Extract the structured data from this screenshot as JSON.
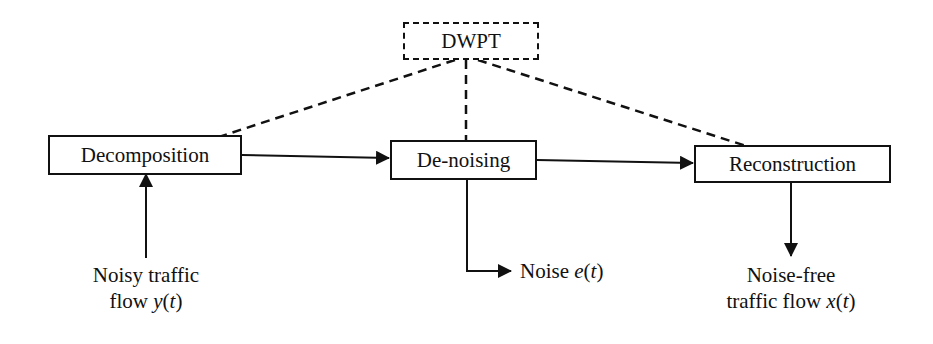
{
  "diagram": {
    "nodes": {
      "dwpt": {
        "label": "DWPT",
        "style": "dashed"
      },
      "decomposition": {
        "label": "Decomposition"
      },
      "denoising": {
        "label": "De-noising"
      },
      "reconstruction": {
        "label": "Reconstruction"
      }
    },
    "labels": {
      "input": {
        "line1": "Noisy traffic",
        "line2_text": "flow ",
        "line2_var": "y",
        "line2_open": "(",
        "line2_t": "t",
        "line2_close": ")"
      },
      "noise": {
        "text": "Noise ",
        "var": "e",
        "open": "(",
        "t": "t",
        "close": ")"
      },
      "output": {
        "line1": "Noise-free",
        "line2_text": "traffic flow ",
        "line2_var": "x",
        "line2_open": "(",
        "line2_t": "t",
        "line2_close": ")"
      }
    },
    "edges": [
      {
        "from": "DWPT",
        "to": "Decomposition",
        "style": "dashed"
      },
      {
        "from": "DWPT",
        "to": "De-noising",
        "style": "dashed"
      },
      {
        "from": "DWPT",
        "to": "Reconstruction",
        "style": "dashed"
      },
      {
        "from": "Decomposition",
        "to": "De-noising",
        "style": "solid"
      },
      {
        "from": "De-noising",
        "to": "Reconstruction",
        "style": "solid"
      },
      {
        "from": "Noisy traffic flow y(t)",
        "to": "Decomposition",
        "style": "solid"
      },
      {
        "from": "De-noising",
        "to": "Noise e(t)",
        "style": "solid"
      },
      {
        "from": "Reconstruction",
        "to": "Noise-free traffic flow x(t)",
        "style": "solid"
      }
    ]
  }
}
